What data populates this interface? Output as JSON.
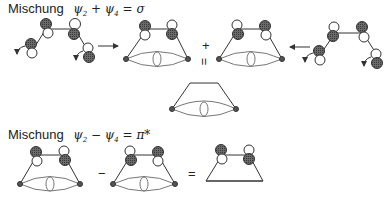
{
  "diagram": {
    "row1": {
      "label": "Mischung",
      "psi_a": "ψ",
      "sub_a": "2",
      "op": " + ",
      "psi_b": "ψ",
      "sub_b": "4",
      "result": " = σ"
    },
    "row2": {
      "label": "Mischung",
      "psi_a": "ψ",
      "sub_a": "2",
      "op": " − ",
      "psi_b": "ψ",
      "sub_b": "4",
      "result": " = π*"
    },
    "operators": {
      "plus": "+",
      "equals_vertical": "=",
      "minus": "−",
      "equals": "="
    },
    "colors": {
      "line": "#333333",
      "shaded": "#555555",
      "open": "#ffffff"
    }
  }
}
